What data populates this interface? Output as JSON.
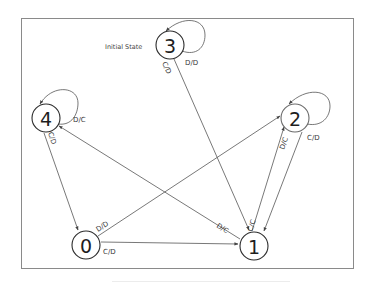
{
  "diagram": {
    "type": "state-transition",
    "annotation": "Initial State",
    "initial_state": "3",
    "colors": {
      "node_stroke": "#2b2b2b",
      "edge": "#555555",
      "text": "#3a3a3a",
      "frame": "#8a8a8a"
    },
    "nodes": [
      {
        "id": "0",
        "label": "0"
      },
      {
        "id": "1",
        "label": "1"
      },
      {
        "id": "2",
        "label": "2"
      },
      {
        "id": "3",
        "label": "3"
      },
      {
        "id": "4",
        "label": "4"
      }
    ],
    "edges": [
      {
        "from": "3",
        "to": "3",
        "label": "D/D"
      },
      {
        "from": "3",
        "to": "1",
        "label": "C/D"
      },
      {
        "from": "4",
        "to": "4",
        "label": "D/C"
      },
      {
        "from": "4",
        "to": "0",
        "label": "C/D"
      },
      {
        "from": "2",
        "to": "2",
        "label": "C/D"
      },
      {
        "from": "2",
        "to": "1",
        "label": "D/C"
      },
      {
        "from": "1",
        "to": "2",
        "label": "C/C"
      },
      {
        "from": "1",
        "to": "4",
        "label": "D/C"
      },
      {
        "from": "0",
        "to": "2",
        "label": "D/D"
      },
      {
        "from": "0",
        "to": "1",
        "label": "C/D"
      }
    ]
  }
}
